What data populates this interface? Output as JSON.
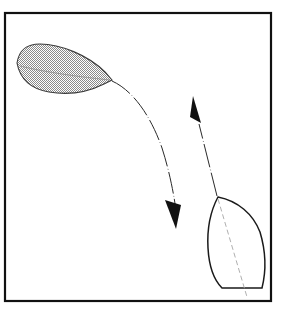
{
  "figure": {
    "kind": "technical-line-diagram",
    "background_color": "#ffffff",
    "line_color": "#1a1a1a",
    "hatch_color": "#7a7a7a",
    "centerline_color": "#9a9a9a",
    "border": {
      "name": "figure-border",
      "x": 5,
      "y": 13,
      "width": 266,
      "height": 288,
      "stroke_width": 2.2,
      "color": "#111111"
    },
    "shapes": [
      {
        "id": "hatched-hull",
        "label": "stippled boat hull, upper left, pointing right",
        "fill": "stipple",
        "stroke_width": 1.1,
        "outline": "M 17,63 C 19,50 26,44 40,44 C 60,44 88,55 105,72 L 112,80 L 104,84 C 86,93 66,95 49,92 C 31,89 20,79 17,63 Z",
        "centerline": "M 20,66 C 44,72 80,77 110,80",
        "bbox": [
          16,
          43,
          113,
          95
        ]
      },
      {
        "id": "open-hull",
        "label": "outlined boat hull, lower right, pointing up",
        "fill": "none",
        "stroke_width": 1.5,
        "outline": "M 218,197 C 210,212 207,230 208,248 C 209,266 214,280 222,288 L 262,288 C 266,272 266,252 260,232 C 253,214 238,201 218,197 Z",
        "centerline": "M 218,199 L 247,297",
        "bbox": [
          206,
          195,
          268,
          290
        ]
      }
    ],
    "paths": [
      {
        "id": "descending-path",
        "label": "curved dash-dot trajectory from hatched hull bow sweeping down-right",
        "style": "dash-dot",
        "stroke_width": 1.0,
        "d": "M 112,81 C 132,90 150,114 162,148 C 170,173 174,196 176,210",
        "arrow": {
          "id": "down-arrowhead",
          "direction": "down",
          "tip": [
            176,
            229
          ],
          "polygon": "165,200 181,205 176,229",
          "fill": "#111111"
        }
      },
      {
        "id": "ascending-path",
        "label": "straight dash-dot trajectory from open hull bow heading up-left",
        "style": "dash-dot",
        "stroke_width": 1.0,
        "d": "M 217,196 L 199,124",
        "arrow": {
          "id": "up-arrowhead",
          "direction": "up",
          "tip": [
            193,
            96
          ],
          "polygon": "193,96 201,123 190,117",
          "fill": "#111111"
        }
      }
    ]
  }
}
